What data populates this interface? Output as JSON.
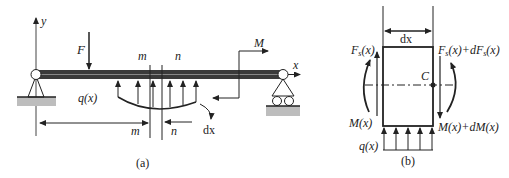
{
  "figure": {
    "panel_a": {
      "caption": "(a)",
      "axis_y": "y",
      "axis_x": "x",
      "force": "F",
      "moment": "M",
      "distributed_load": "q(x)",
      "section_left_top": "m",
      "section_right_top": "n",
      "dim_left": "m",
      "dim_right": "n",
      "element_width": "dx"
    },
    "panel_b": {
      "caption": "(b)",
      "width_label": "dx",
      "shear_left_main": "F",
      "shear_left_sub": "s",
      "shear_left_arg": "(x)",
      "shear_right": "F",
      "shear_right_sub": "s",
      "shear_right_mid": "(x)+dF",
      "shear_right_sub2": "s",
      "shear_right_end": "(x)",
      "moment_left": "M(x)",
      "moment_right": "M(x)+dM(x)",
      "centroid": "C",
      "load": "q(x)"
    },
    "colors": {
      "ink": "#222222",
      "beam": "#3a3a3a",
      "ground": "#bdbdbd"
    }
  }
}
